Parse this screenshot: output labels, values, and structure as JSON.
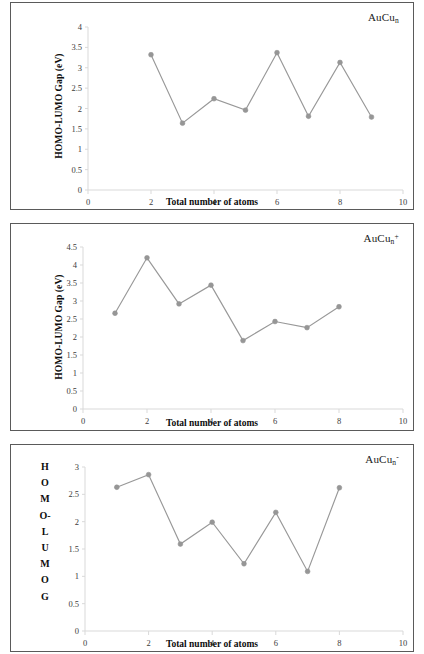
{
  "figure": {
    "name": "homo-lumo-gap-figure",
    "panel_count": 3,
    "marker_color": "#969696",
    "line_color": "#989898",
    "axis_color": "#d9d9d9",
    "border_color": "#5a5a5a"
  },
  "panels": [
    {
      "id": "panel-neutral",
      "species_html": "AuCu<sub>n</sub>",
      "species_plain": "AuCun",
      "ylabel": "HOMO-LUMO Gap (eV)",
      "ylabel_mode": "rotated",
      "xlabel": "Total number of atoms",
      "yticks": [
        "0",
        "0.5",
        "1",
        "1.5",
        "2",
        "2.5",
        "3",
        "3.5",
        "4"
      ],
      "xticks": [
        "0",
        "2",
        "4",
        "6",
        "8",
        "10"
      ]
    },
    {
      "id": "panel-cation",
      "species_html": "AuCu<sub>n</sub><sup>+</sup>",
      "species_plain": "AuCun+",
      "ylabel": "HOMO-LUMO Gap (eV)",
      "ylabel_mode": "rotated",
      "xlabel": "Total number of atoms",
      "yticks": [
        "0",
        "0.5",
        "1",
        "1.5",
        "2",
        "2.5",
        "3",
        "3.5",
        "4",
        "4.5"
      ],
      "xticks": [
        "0",
        "2",
        "4",
        "6",
        "8",
        "10"
      ]
    },
    {
      "id": "panel-anion",
      "species_html": "AuCu<sub>n</sub><sup>-</sup>",
      "species_plain": "AuCun-",
      "ylabel_letters": [
        "H",
        "O",
        "M",
        "O-",
        "L",
        "U",
        "M",
        "O",
        "G"
      ],
      "ylabel_mode": "stacked",
      "xlabel": "Total number of atoms",
      "yticks": [
        "0",
        "0.5",
        "1",
        "1.5",
        "2",
        "2.5",
        "3"
      ],
      "xticks": [
        "0",
        "2",
        "4",
        "6",
        "8",
        "10"
      ]
    }
  ],
  "chart_data": [
    {
      "type": "line",
      "title": "AuCun",
      "xlabel": "Total number of atoms",
      "ylabel": "HOMO-LUMO Gap (eV)",
      "x": [
        2,
        3,
        4,
        5,
        6,
        7,
        8,
        9
      ],
      "values": [
        3.32,
        1.64,
        2.24,
        1.96,
        3.37,
        1.81,
        3.13,
        1.79
      ],
      "xlim": [
        0,
        10
      ],
      "ylim": [
        0,
        4
      ],
      "ytick_step": 0.5,
      "xtick_step": 2,
      "grid": false,
      "legend": false,
      "marker": "circle",
      "series": [
        {
          "name": "AuCun HOMO-LUMO gap",
          "values": [
            3.32,
            1.64,
            2.24,
            1.96,
            3.37,
            1.81,
            3.13,
            1.79
          ]
        }
      ]
    },
    {
      "type": "line",
      "title": "AuCun+",
      "xlabel": "Total number of atoms",
      "ylabel": "HOMO-LUMO Gap (eV)",
      "x": [
        1,
        2,
        3,
        4,
        5,
        6,
        7,
        8
      ],
      "values": [
        2.66,
        4.2,
        2.92,
        3.44,
        1.9,
        2.43,
        2.26,
        2.84
      ],
      "xlim": [
        0,
        10
      ],
      "ylim": [
        0,
        4.5
      ],
      "ytick_step": 0.5,
      "xtick_step": 2,
      "grid": false,
      "legend": false,
      "marker": "circle",
      "series": [
        {
          "name": "AuCun+ HOMO-LUMO gap",
          "values": [
            2.66,
            4.2,
            2.92,
            3.44,
            1.9,
            2.43,
            2.26,
            2.84
          ]
        }
      ]
    },
    {
      "type": "line",
      "title": "AuCun-",
      "xlabel": "Total number of atoms",
      "ylabel": "HOMO-LUMO G",
      "x": [
        1,
        2,
        3,
        4,
        5,
        6,
        7,
        8
      ],
      "values": [
        2.63,
        2.86,
        1.59,
        1.99,
        1.23,
        2.17,
        1.09,
        2.62
      ],
      "xlim": [
        0,
        10
      ],
      "ylim": [
        0,
        3
      ],
      "ytick_step": 0.5,
      "xtick_step": 2,
      "grid": false,
      "legend": false,
      "marker": "circle",
      "series": [
        {
          "name": "AuCun- HOMO-LUMO gap",
          "values": [
            2.63,
            2.86,
            1.59,
            1.99,
            1.23,
            2.17,
            1.09,
            2.62
          ]
        }
      ]
    }
  ]
}
